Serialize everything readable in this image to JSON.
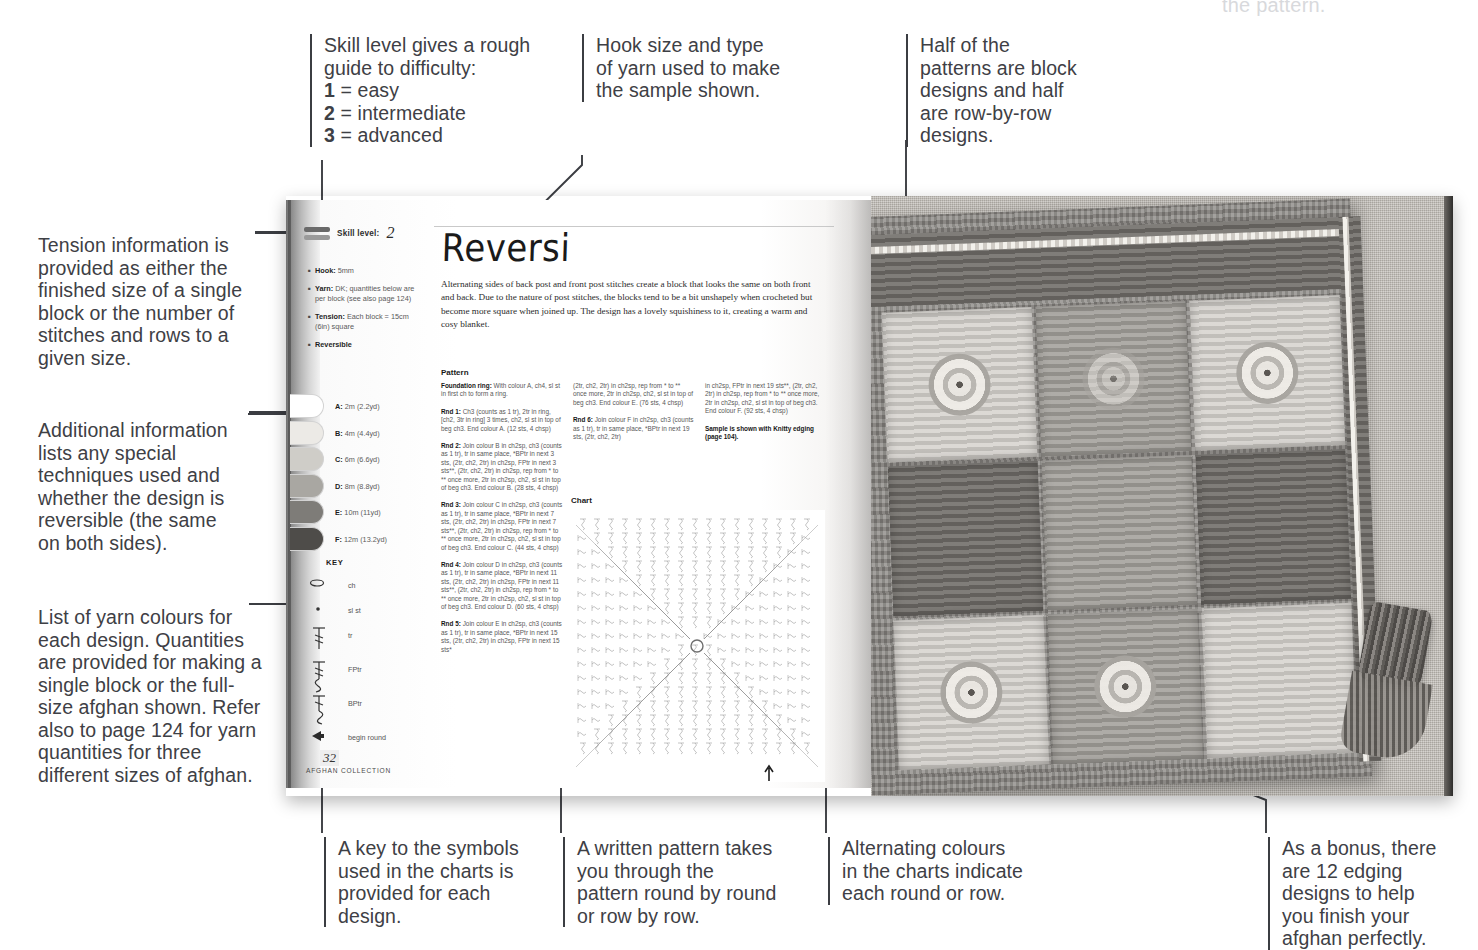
{
  "annotations": {
    "ghost_top_right": "the pattern.",
    "skill_level": "Skill level gives a rough guide to difficulty:",
    "skill_1": "1",
    "skill_1_rest": " = easy",
    "skill_2": "2",
    "skill_2_rest": " = intermediate",
    "skill_3": "3",
    "skill_3_rest": " = advanced",
    "hook_yarn": "Hook size and type of yarn used to make the sample shown.",
    "block_designs": "Half of the patterns are block designs and half are row-by-row designs.",
    "tension": "Tension information is provided as either the finished size of a single block or the number of stitches and rows to a given size.",
    "additional_info": "Additional information lists any special techniques used and whether the design is reversible (the same on both sides).",
    "yarn_colours": "List of yarn colours for each design. Quantities are provided for making a single block or the full-size afghan shown. Refer also to page 124 for yarn quantities for three different sizes of afghan.",
    "key_symbols": "A key to the symbols used in the charts is provided for each design.",
    "written_pattern": "A written pattern takes you through the pattern round by round or row by row.",
    "alternating_colours": "Alternating colours in the charts indicate each round or row.",
    "bonus_edgings": "As a bonus, there are 12 edging designs to help you finish your afghan perfectly."
  },
  "book": {
    "skill": {
      "label": "Skill level:",
      "value": "2"
    },
    "meta": [
      {
        "label": "Hook:",
        "text": " 5mm"
      },
      {
        "label": "Yarn:",
        "text": " DK; quantities below are per block (see also page 124)"
      },
      {
        "label": "Tension:",
        "text": " Each block = 15cm (6in) square"
      },
      {
        "label": "Reversible",
        "text": ""
      }
    ],
    "yarns": [
      {
        "letter": "A:",
        "amount": " 2m (2.2yd)",
        "colour": "#ffffff"
      },
      {
        "letter": "B:",
        "amount": " 4m (4.4yd)",
        "colour": "#eceae6"
      },
      {
        "letter": "C:",
        "amount": " 6m (6.6yd)",
        "colour": "#cfcdc8"
      },
      {
        "letter": "D:",
        "amount": " 8m (8.8yd)",
        "colour": "#a9a7a2"
      },
      {
        "letter": "E:",
        "amount": " 10m (11yd)",
        "colour": "#7e7c78"
      },
      {
        "letter": "F:",
        "amount": " 12m (13.2yd)",
        "colour": "#4e4c49"
      }
    ],
    "key": {
      "title": "KEY",
      "items": [
        {
          "symbol": "ch-oval-icon",
          "label": "ch"
        },
        {
          "symbol": "slst-dot-icon",
          "label": "sl st"
        },
        {
          "symbol": "tr-icon",
          "label": "tr"
        },
        {
          "symbol": "fptr-icon",
          "label": "FPtr"
        },
        {
          "symbol": "bptr-icon",
          "label": "BPtr"
        },
        {
          "symbol": "begin-round-arrow-icon",
          "label": "begin round"
        }
      ]
    },
    "title": "Reversi",
    "intro": "Alternating sides of back post and front post stitches create a block that looks the same on both front and back. Due to the nature of post stitches, the blocks tend to be a bit unshapely when crocheted but become more square when joined up. The design has a lovely squishiness to it, creating a warm and cosy blanket.",
    "pattern_heading": "Pattern",
    "chart_heading": "Chart",
    "pattern_col1": [
      {
        "label": "Foundation ring:",
        "text": " With colour A, ch4, sl st in first ch to form a ring."
      },
      {
        "label": "Rnd 1:",
        "text": " Ch3 (counts as 1 tr), 2tr in ring, [ch2, 3tr in ring] 3 times, ch2, sl st in top of beg ch3. End colour A. (12 sts, 4 chsp)"
      },
      {
        "label": "Rnd 2:",
        "text": " Join colour B in ch2sp, ch3 (counts as 1 tr), tr in same place, *BPtr in next 3 sts, (2tr, ch2, 2tr) in ch2sp, FPtr in next 3 sts**, (2tr, ch2, 2tr) in ch2sp, rep from * to ** once more, 2tr in ch2sp, ch2, sl st in top of beg ch3. End colour B. (28 sts, 4 chsp)"
      },
      {
        "label": "Rnd 3:",
        "text": " Join colour C in ch2sp, ch3 (counts as 1 tr), tr in same place, *BPtr in next 7 sts, (2tr, ch2, 2tr) in ch2sp, FPtr in next 7 sts**, (2tr, ch2, 2tr) in ch2sp, rep from * to ** once more, 2tr in ch2sp, ch2, sl st in top of beg ch3. End colour C. (44 sts, 4 chsp)"
      },
      {
        "label": "Rnd 4:",
        "text": " Join colour D in ch2sp, ch3 (counts as 1 tr), tr in same place, *BPtr in next 11 sts, (2tr, ch2, 2tr) in ch2sp, FPtr in next 11 sts**, (2tr, ch2, 2tr) in ch2sp, rep from * to ** once more, 2tr in ch2sp, ch2, sl st in top of beg ch3. End colour D. (60 sts, 4 chsp)"
      },
      {
        "label": "Rnd 5:",
        "text": " Join colour E in ch2sp, ch3 (counts as 1 tr), tr in same place, *BPtr in next 15 sts, (2tr, ch2, 2tr) in ch2sp, FPtr in next 15 sts*"
      }
    ],
    "pattern_col2": [
      {
        "label": "",
        "text": "(2tr, ch2, 2tr) in ch2sp, rep from * to ** once more, 2tr in ch2sp, ch2, sl st in top of beg ch3. End colour E. (76 sts, 4 chsp)"
      },
      {
        "label": "Rnd 6:",
        "text": " Join colour F in ch2sp, ch3 (counts as 1 tr), tr in same place, *BPtr in next 19 sts, (2tr, ch2, 2tr)"
      }
    ],
    "pattern_col3": [
      {
        "label": "",
        "text": "in ch2sp, FPtr in next 19 sts**, (2tr, ch2, 2tr) in ch2sp, rep from * to ** once more, 2tr in ch2sp, ch2, sl st in top of beg ch3. End colour F. (92 sts, 4 chsp)"
      },
      {
        "label": "Sample is shown with Knitty edging (page 104).",
        "text": ""
      }
    ],
    "folio": {
      "number": "32",
      "text": "AFGHAN COLLECTION"
    }
  },
  "colors": {
    "ink": "#3e4045",
    "rule": "#3b3d42",
    "ghost": "#d8d9dc"
  }
}
